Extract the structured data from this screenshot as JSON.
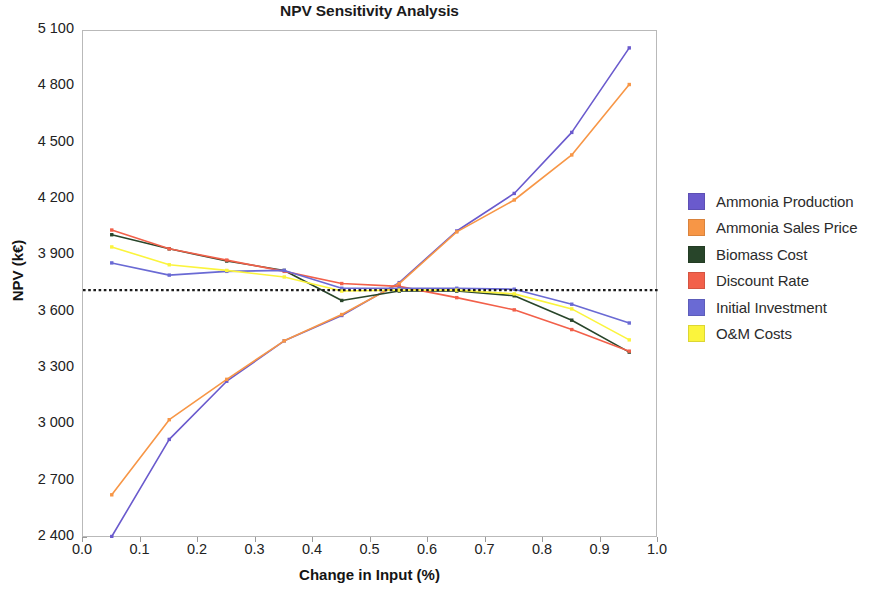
{
  "chart_data": {
    "type": "line",
    "title": "NPV Sensitivity Analysis",
    "xlabel": "Change in Input (%)",
    "ylabel": "NPV (k€)",
    "xlim": [
      0.0,
      1.0
    ],
    "ylim": [
      2400,
      5100
    ],
    "xticks": [
      "0.0",
      "0.1",
      "0.2",
      "0.3",
      "0.4",
      "0.5",
      "0.6",
      "0.7",
      "0.8",
      "0.9",
      "1.0"
    ],
    "xtick_values": [
      0.0,
      0.1,
      0.2,
      0.3,
      0.4,
      0.5,
      0.6,
      0.7,
      0.8,
      0.9,
      1.0
    ],
    "yticks": [
      "2 400",
      "2 700",
      "3 000",
      "3 300",
      "3 600",
      "3 900",
      "4 200",
      "4 500",
      "4 800",
      "5 100"
    ],
    "ytick_values": [
      2400,
      2700,
      3000,
      3300,
      3600,
      3900,
      4200,
      4500,
      4800,
      5100
    ],
    "grid": false,
    "legend_position": "right",
    "baseline": {
      "value": 3720,
      "style": "dashed",
      "color": "#1a1a1a"
    },
    "x": [
      0.05,
      0.15,
      0.25,
      0.35,
      0.45,
      0.55,
      0.65,
      0.75,
      0.85,
      0.95
    ],
    "series": [
      {
        "name": "Ammonia Production",
        "color": "#6a5acd",
        "values": [
          2408,
          2925,
          3235,
          3450,
          3585,
          3760,
          4035,
          4235,
          4560,
          5010
        ]
      },
      {
        "name": "Ammonia Sales Price",
        "color": "#f79646",
        "values": [
          2630,
          3030,
          3245,
          3450,
          3590,
          3755,
          4030,
          4200,
          4440,
          4815
        ]
      },
      {
        "name": "Biomass Cost",
        "color": "#28452a",
        "values": [
          4015,
          3940,
          3875,
          3825,
          3665,
          3715,
          3715,
          3690,
          3560,
          3390
        ]
      },
      {
        "name": "Discount Rate",
        "color": "#f2604a",
        "values": [
          4040,
          3940,
          3880,
          3820,
          3755,
          3740,
          3680,
          3615,
          3510,
          3395
        ]
      },
      {
        "name": "Initial Investment",
        "color": "#6a6ad4",
        "values": [
          3865,
          3800,
          3820,
          3825,
          3730,
          3730,
          3730,
          3725,
          3645,
          3545
        ]
      },
      {
        "name": "O&M Costs",
        "color": "#fbf43c",
        "values": [
          3950,
          3855,
          3825,
          3790,
          3715,
          3720,
          3720,
          3700,
          3620,
          3455
        ]
      }
    ]
  },
  "legend": {
    "items": [
      {
        "label": "Ammonia Production",
        "color": "#6a5acd"
      },
      {
        "label": "Ammonia Sales Price",
        "color": "#f79646"
      },
      {
        "label": "Biomass Cost",
        "color": "#28452a"
      },
      {
        "label": "Discount Rate",
        "color": "#f2604a"
      },
      {
        "label": "Initial Investment",
        "color": "#6a6ad4"
      },
      {
        "label": "O&M Costs",
        "color": "#fbf43c"
      }
    ]
  }
}
